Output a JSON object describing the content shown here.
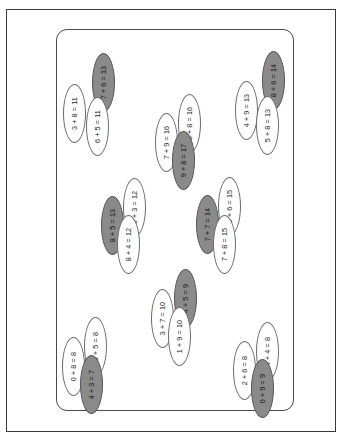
{
  "page": {
    "background_color": "#ffffff",
    "frame_border_color": "#3a3a3a",
    "card_border_color": "#4a4a4a"
  },
  "legend": {
    "white_fill": "#ffffff",
    "gray_fill": "#8a8a8a",
    "outline": "#6b6b6b"
  },
  "clusters": [
    {
      "name": "top-left",
      "items": [
        {
          "text": "3 + 8 = 11",
          "fill": "white"
        },
        {
          "text": "7 + 6 = 13",
          "fill": "gray"
        },
        {
          "text": "6 + 5 = 11",
          "fill": "white"
        }
      ]
    },
    {
      "name": "top-right",
      "items": [
        {
          "text": "4 + 9 = 13",
          "fill": "white"
        },
        {
          "text": "8 + 6 = 14",
          "fill": "gray"
        },
        {
          "text": "5 + 8 = 13",
          "fill": "white"
        }
      ]
    },
    {
      "name": "center-top",
      "items": [
        {
          "text": "7 + 9 = 16",
          "fill": "white"
        },
        {
          "text": "8 + 8 = 16",
          "fill": "white"
        },
        {
          "text": "9 + 8 = 17",
          "fill": "gray"
        }
      ]
    },
    {
      "name": "middle-left",
      "items": [
        {
          "text": "8 + 5 = 13",
          "fill": "gray"
        },
        {
          "text": "9 + 3 = 12",
          "fill": "white"
        },
        {
          "text": "8 + 4 = 12",
          "fill": "white"
        }
      ]
    },
    {
      "name": "middle-right",
      "items": [
        {
          "text": "7 + 7 = 14",
          "fill": "gray"
        },
        {
          "text": "9 + 6 = 15",
          "fill": "white"
        },
        {
          "text": "7 + 8 = 15",
          "fill": "white"
        }
      ]
    },
    {
      "name": "center-bottom",
      "items": [
        {
          "text": "3 + 7 = 10",
          "fill": "white"
        },
        {
          "text": "4 + 5 = 9",
          "fill": "gray"
        },
        {
          "text": "1 + 9 = 10",
          "fill": "white"
        }
      ]
    },
    {
      "name": "bottom-left",
      "items": [
        {
          "text": "0 + 8 = 8",
          "fill": "white"
        },
        {
          "text": "3 + 5 = 8",
          "fill": "white"
        },
        {
          "text": "4 + 3 = 7",
          "fill": "gray"
        }
      ]
    },
    {
      "name": "bottom-right",
      "items": [
        {
          "text": "2 + 6 = 8",
          "fill": "white"
        },
        {
          "text": "4 + 4 = 8",
          "fill": "white"
        },
        {
          "text": "0 + 9 = 9",
          "fill": "gray"
        }
      ]
    }
  ],
  "nodes": [
    {
      "cluster": 0,
      "index": 0,
      "x": 63,
      "y": 84
    },
    {
      "cluster": 0,
      "index": 1,
      "x": 92,
      "y": 53
    },
    {
      "cluster": 0,
      "index": 2,
      "x": 86,
      "y": 97
    },
    {
      "cluster": 1,
      "index": 0,
      "x": 235,
      "y": 81
    },
    {
      "cluster": 1,
      "index": 1,
      "x": 262,
      "y": 51
    },
    {
      "cluster": 1,
      "index": 2,
      "x": 256,
      "y": 96
    },
    {
      "cluster": 2,
      "index": 0,
      "x": 155,
      "y": 113
    },
    {
      "cluster": 2,
      "index": 1,
      "x": 178,
      "y": 94
    },
    {
      "cluster": 2,
      "index": 2,
      "x": 172,
      "y": 131
    },
    {
      "cluster": 3,
      "index": 0,
      "x": 101,
      "y": 196
    },
    {
      "cluster": 3,
      "index": 1,
      "x": 123,
      "y": 178
    },
    {
      "cluster": 3,
      "index": 2,
      "x": 117,
      "y": 215
    },
    {
      "cluster": 4,
      "index": 0,
      "x": 196,
      "y": 195
    },
    {
      "cluster": 4,
      "index": 1,
      "x": 218,
      "y": 177
    },
    {
      "cluster": 4,
      "index": 2,
      "x": 213,
      "y": 215
    },
    {
      "cluster": 5,
      "index": 0,
      "x": 151,
      "y": 289
    },
    {
      "cluster": 5,
      "index": 1,
      "x": 174,
      "y": 269
    },
    {
      "cluster": 5,
      "index": 2,
      "x": 168,
      "y": 307
    },
    {
      "cluster": 6,
      "index": 0,
      "x": 62,
      "y": 337
    },
    {
      "cluster": 6,
      "index": 1,
      "x": 84,
      "y": 317
    },
    {
      "cluster": 6,
      "index": 2,
      "x": 80,
      "y": 355
    },
    {
      "cluster": 7,
      "index": 0,
      "x": 233,
      "y": 341
    },
    {
      "cluster": 7,
      "index": 1,
      "x": 256,
      "y": 322
    },
    {
      "cluster": 7,
      "index": 2,
      "x": 251,
      "y": 359
    }
  ]
}
